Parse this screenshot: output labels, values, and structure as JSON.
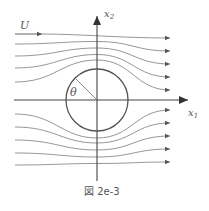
{
  "figure": {
    "caption": "図 2e-3",
    "labels": {
      "freestream": "U",
      "vertical_axis": "x",
      "vertical_axis_sub": "2",
      "horizontal_axis": "x",
      "horizontal_axis_sub": "1",
      "angle": "θ"
    },
    "colors": {
      "streamline": "#8a8a8a",
      "axis": "#444444",
      "circle": "#555555",
      "text": "#555555"
    },
    "geometry": {
      "center": [
        97,
        100
      ],
      "radius": 31,
      "upper_streamlines": [
        {
          "y_start": 34,
          "y_end": 38,
          "dip": 0
        },
        {
          "y_start": 44,
          "y_end": 51,
          "dip": 6
        },
        {
          "y_start": 56,
          "y_end": 64,
          "dip": 12
        },
        {
          "y_start": 68,
          "y_end": 77,
          "dip": 18
        },
        {
          "y_start": 82,
          "y_end": 90,
          "dip": 26
        }
      ],
      "lower_streamlines": [
        {
          "y_start": 114,
          "y_end": 110,
          "dip": 26
        },
        {
          "y_start": 127,
          "y_end": 123,
          "dip": 18
        },
        {
          "y_start": 140,
          "y_end": 136,
          "dip": 12
        },
        {
          "y_start": 153,
          "y_end": 149,
          "dip": 6
        },
        {
          "y_start": 165,
          "y_end": 162,
          "dip": 0
        }
      ]
    }
  }
}
